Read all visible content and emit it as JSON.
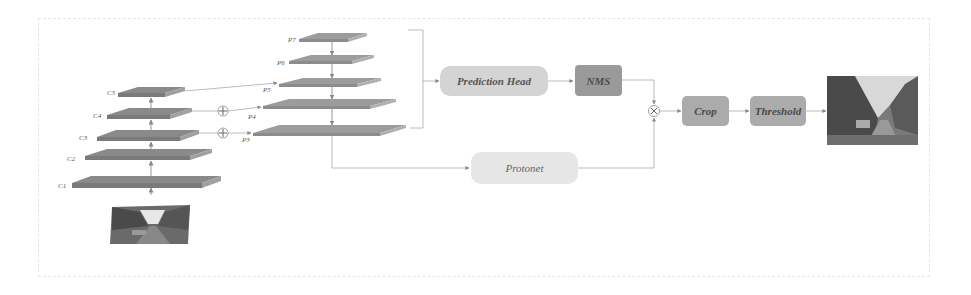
{
  "diagram": {
    "title": "",
    "backbone_layers": [
      {
        "id": "C1",
        "label": "C1"
      },
      {
        "id": "C2",
        "label": "C2"
      },
      {
        "id": "C3",
        "label": "C3"
      },
      {
        "id": "C4",
        "label": "C4"
      },
      {
        "id": "C5",
        "label": "C5"
      }
    ],
    "fpn_layers": [
      {
        "id": "P7",
        "label": "P7"
      },
      {
        "id": "P6",
        "label": "P6"
      },
      {
        "id": "P5",
        "label": "P5"
      },
      {
        "id": "P4",
        "label": "P4"
      },
      {
        "id": "P3",
        "label": "P3"
      }
    ],
    "operators": {
      "add_symbol": "+",
      "multiply_symbol": "×"
    },
    "blocks": {
      "prediction_head": "Prediction Head",
      "nms": "NMS",
      "protonet": "Protonet",
      "crop": "Crop",
      "threshold": "Threshold"
    },
    "images": {
      "input": "input-street-scene",
      "output": "output-street-scene-segmented"
    },
    "colors": {
      "layer_fill": "#8a8a8a",
      "fpn_layer_fill": "#9c9c9c",
      "prediction_head_fill": "#d4d4d4",
      "protonet_fill": "#e6e6e6",
      "nms_fill": "#9a9a9a",
      "crop_threshold_fill": "#ababab",
      "connector": "#9a9a9a"
    }
  }
}
